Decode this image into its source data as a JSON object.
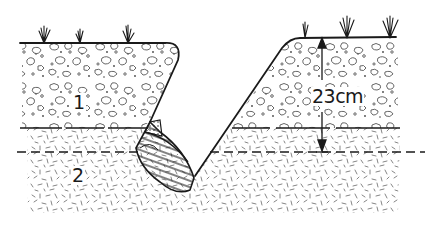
{
  "diagram": {
    "type": "soil-cross-section",
    "labels": {
      "layer_1": "1",
      "layer_2": "2",
      "depth_measure": "23cm"
    },
    "layers": [
      {
        "id": "1",
        "name": "topsoil",
        "pattern": "pebbles"
      },
      {
        "id": "2",
        "name": "subsoil",
        "pattern": "dashes"
      }
    ],
    "measurement": {
      "value": 23,
      "unit": "cm",
      "from": "ground-surface",
      "to": "dashed-line"
    },
    "colors": {
      "ink": "#1a1a1a",
      "background": "#ffffff",
      "texture": "#555555"
    }
  }
}
